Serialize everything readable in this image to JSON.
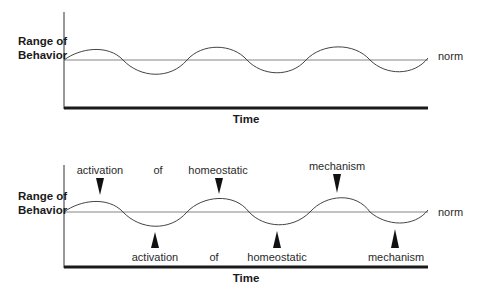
{
  "top_diagram": {
    "y_label_line1": "Range of",
    "y_label_line2": "Behavior",
    "x_label": "Time",
    "norm_label": "norm"
  },
  "bottom_diagram": {
    "y_label_line1": "Range of",
    "y_label_line2": "Behavior",
    "x_label": "Time",
    "norm_label": "norm",
    "upper_annotations": [
      {
        "text": "activation",
        "arrow": "down"
      },
      {
        "text": "of",
        "arrow": "none"
      },
      {
        "text": "homeostatic",
        "arrow": "down"
      },
      {
        "text": "mechanism",
        "arrow": "down"
      }
    ],
    "lower_annotations": [
      {
        "text": "activation",
        "arrow": "up"
      },
      {
        "text": "of",
        "arrow": "none"
      },
      {
        "text": "homeostatic",
        "arrow": "up"
      },
      {
        "text": "mechanism",
        "arrow": "up"
      }
    ]
  },
  "colors": {
    "line": "#444444",
    "axis": "#1a1a1a",
    "background": "#ffffff"
  }
}
